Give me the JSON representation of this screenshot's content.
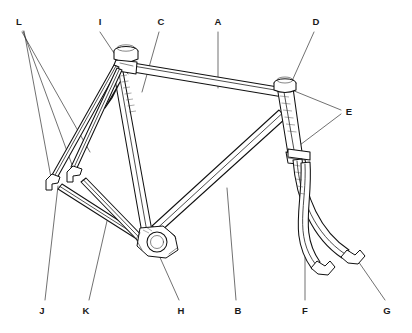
{
  "figure": {
    "background_color": "#ffffff",
    "line_color": "#111111",
    "leader_color": "#333333",
    "label_color": "#1a1a1a",
    "width": 412,
    "height": 333
  },
  "labels": [
    {
      "id": "L",
      "text": "L",
      "x": 19,
      "y": 22,
      "position": "top",
      "target": "rear-dropout-and-stays"
    },
    {
      "id": "I",
      "text": "I",
      "x": 100,
      "y": 22,
      "position": "top",
      "target": "seat-lug-cluster"
    },
    {
      "id": "C",
      "text": "C",
      "x": 161,
      "y": 22,
      "position": "top",
      "target": "seat-tube"
    },
    {
      "id": "A",
      "text": "A",
      "x": 218,
      "y": 22,
      "position": "top",
      "target": "top-tube"
    },
    {
      "id": "D",
      "text": "D",
      "x": 316,
      "y": 22,
      "position": "top",
      "target": "head-tube"
    },
    {
      "id": "E",
      "text": "E",
      "x": 349,
      "y": 112,
      "position": "right",
      "target": "head-lug-joints"
    },
    {
      "id": "J",
      "text": "J",
      "x": 42,
      "y": 311,
      "position": "bottom",
      "target": "seat-stay"
    },
    {
      "id": "K",
      "text": "K",
      "x": 86,
      "y": 311,
      "position": "bottom",
      "target": "chain-stay"
    },
    {
      "id": "H",
      "text": "H",
      "x": 181,
      "y": 311,
      "position": "bottom",
      "target": "bottom-bracket-shell"
    },
    {
      "id": "B",
      "text": "B",
      "x": 238,
      "y": 311,
      "position": "bottom",
      "target": "down-tube"
    },
    {
      "id": "F",
      "text": "F",
      "x": 305,
      "y": 311,
      "position": "bottom",
      "target": "fork-blade"
    },
    {
      "id": "G",
      "text": "G",
      "x": 387,
      "y": 311,
      "position": "bottom",
      "target": "fork-dropout"
    }
  ],
  "leaders": [
    {
      "id": "L1",
      "label": "L",
      "path": "M 22 32 L 90 152"
    },
    {
      "id": "L2",
      "label": "L",
      "path": "M 23 31 L 75 173"
    },
    {
      "id": "L3",
      "label": "L",
      "path": "M 24 31 L 52 183"
    },
    {
      "id": "I1",
      "label": "I",
      "path": "M 100 32 L 128 74"
    },
    {
      "id": "C1",
      "label": "C",
      "path": "M 159 32 L 142 90"
    },
    {
      "id": "A1",
      "label": "A",
      "path": "M 218 32 L 218 88"
    },
    {
      "id": "D1",
      "label": "D",
      "path": "M 314 32 L 288 90"
    },
    {
      "id": "E1",
      "label": "E",
      "path": "M 341 110 L 282 86"
    },
    {
      "id": "E2",
      "label": "E",
      "path": "M 341 114 L 295 148"
    },
    {
      "id": "J1",
      "label": "J",
      "path": "M 45 300 L 58 186"
    },
    {
      "id": "K1",
      "label": "K",
      "path": "M 89 300 L 106 222"
    },
    {
      "id": "H1",
      "label": "H",
      "path": "M 179 300 L 154 244"
    },
    {
      "id": "B1",
      "label": "B",
      "path": "M 236 300 L 226 188"
    },
    {
      "id": "F1",
      "label": "F",
      "path": "M 305 300 L 305 168"
    },
    {
      "id": "G1",
      "label": "G",
      "path": "M 385 300 L 358 261"
    }
  ],
  "parts": [
    {
      "key": "A",
      "name": "top-tube"
    },
    {
      "key": "B",
      "name": "down-tube"
    },
    {
      "key": "C",
      "name": "seat-tube"
    },
    {
      "key": "D",
      "name": "head-tube"
    },
    {
      "key": "E",
      "name": "head-lug-joints"
    },
    {
      "key": "F",
      "name": "fork-blade"
    },
    {
      "key": "G",
      "name": "fork-dropout"
    },
    {
      "key": "H",
      "name": "bottom-bracket-shell"
    },
    {
      "key": "I",
      "name": "seat-lug-cluster"
    },
    {
      "key": "J",
      "name": "seat-stay"
    },
    {
      "key": "K",
      "name": "chain-stay"
    },
    {
      "key": "L",
      "name": "rear-dropout"
    }
  ]
}
